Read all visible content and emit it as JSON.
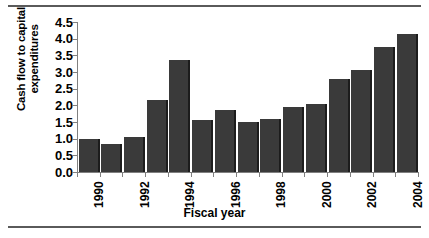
{
  "chart_data": {
    "type": "bar",
    "title": "",
    "xlabel": "Fiscal year",
    "ylabel": "Cash flow to capital expenditures",
    "ylabel_line1": "Cash flow to capital",
    "ylabel_line2": "expenditures",
    "categories": [
      "1990",
      "1991",
      "1992",
      "1993",
      "1994",
      "1995",
      "1996",
      "1997",
      "1998",
      "1999",
      "2000",
      "2001",
      "2002",
      "2003",
      "2004"
    ],
    "values": [
      1.0,
      0.85,
      1.05,
      2.15,
      3.35,
      1.55,
      1.85,
      1.5,
      1.6,
      1.95,
      2.05,
      2.8,
      3.05,
      3.75,
      4.15
    ],
    "tick_labels_shown": [
      "1990",
      "1992",
      "1994",
      "1996",
      "1998",
      "2000",
      "2002",
      "2004"
    ],
    "ylim": [
      0.0,
      4.5
    ],
    "yticks": [
      "0.0",
      "0.5",
      "1.0",
      "1.5",
      "2.0",
      "2.5",
      "3.0",
      "3.5",
      "4.0",
      "4.5"
    ],
    "grid": false,
    "legend": false,
    "bar_color": "#3a3a3a",
    "bar_shadow_color": "#1c1c1c",
    "axis_color": "#808080",
    "frame_color": "#5a5a5a"
  }
}
